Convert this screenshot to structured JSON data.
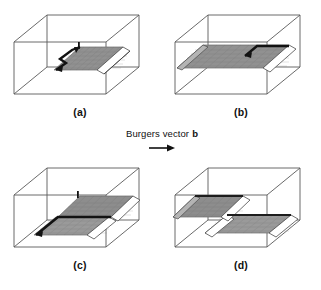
{
  "figure": {
    "panels": [
      {
        "id": "a",
        "label": "(a)",
        "description": "Cubic crystal block with a partially slipped region; zigzag screw dislocation line inside the slip plane",
        "dislocation_visible": true,
        "slipped_fraction": 0.45,
        "step_on_face": "right"
      },
      {
        "id": "b",
        "label": "(b)",
        "description": "Dislocation has glided further; slipped area now spans most of the plane",
        "dislocation_visible": true,
        "slipped_fraction": 0.75,
        "step_on_face": "right"
      },
      {
        "id": "c",
        "label": "(c)",
        "description": "Slip plane with dislocation line and a slip step raised on the near edge",
        "dislocation_visible": true,
        "slipped_fraction": 0.6,
        "step_on_face": "right"
      },
      {
        "id": "d",
        "label": "(d)",
        "description": "Dislocation has left the crystal; two offset slipped planes leave a unit slip step",
        "dislocation_visible": false,
        "slipped_fraction": 1.0,
        "step_on_face": "both"
      }
    ],
    "burgers": {
      "caption": "Burgers vector",
      "symbol": "b",
      "arrow_direction": "right",
      "arrow_glyph": "→"
    },
    "colors": {
      "background": "#ffffff",
      "box_edge": "#595959",
      "slip_plane_fill": "#8f8f8f",
      "slip_plane_fill_light": "#a8a8a8",
      "dislocation_line": "#121212",
      "step_face": "#ffffff",
      "text": "#111111"
    }
  }
}
